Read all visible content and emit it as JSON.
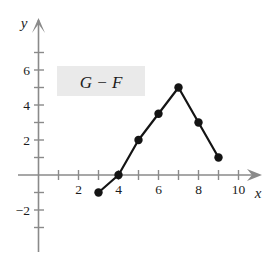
{
  "figure": {
    "cropped_top_text": "10.",
    "axis_label_x": "x",
    "axis_label_y": "y",
    "series_label": "G − F",
    "series_label_bg": "#eaeaea",
    "line_color": "#141414",
    "point_color": "#141414",
    "axis_color": "#8a8a8a",
    "text_color": "#1c1c1c"
  },
  "chart_data": {
    "type": "line",
    "title": "G − F",
    "xlabel": "x",
    "ylabel": "y",
    "grid": false,
    "legend": "none",
    "series": [
      {
        "name": "G − F",
        "x": [
          3,
          4,
          5,
          6,
          7,
          8,
          9
        ],
        "values": [
          -1,
          0,
          2,
          3.5,
          5,
          3,
          1
        ],
        "marker": "filled-circle",
        "color": "#141414"
      }
    ],
    "xlim": [
      0,
      11.6
    ],
    "ylim": [
      -3.6,
      7.2
    ],
    "x_ticks_major": [
      2,
      4,
      6,
      8,
      10
    ],
    "x_tick_labels": [
      "2",
      "4",
      "6",
      "8",
      "10"
    ],
    "x_ticks_minor": [
      1,
      3,
      5,
      7,
      9,
      11
    ],
    "y_ticks_major": [
      -2,
      2,
      4,
      6
    ],
    "y_tick_labels": [
      "−2",
      "2",
      "4",
      "6"
    ],
    "y_ticks_minor": [
      -3,
      -1,
      1,
      3,
      5,
      7
    ],
    "annotations": [
      {
        "text": "G − F",
        "x": 3.1,
        "y": 4.4
      }
    ]
  }
}
